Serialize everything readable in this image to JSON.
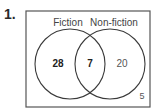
{
  "question_number": "1.",
  "venn": {
    "sets": [
      {
        "label": "Fiction",
        "only_count": "28"
      },
      {
        "label": "Non-fiction",
        "only_count": "20"
      }
    ],
    "intersection_count": "7",
    "outside_count": "5"
  },
  "colors": {
    "stroke": "#3a3a3a",
    "text": "#333333",
    "muted_text": "#555555",
    "background": "#ffffff"
  }
}
